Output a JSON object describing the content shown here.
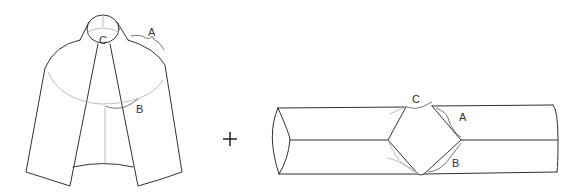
{
  "figure": {
    "left_item": {
      "name": "cape",
      "labels": {
        "a": "A",
        "b": "B",
        "c": "C"
      }
    },
    "operator": "+",
    "right_item": {
      "name": "cylinder-with-diamond-cutout",
      "labels": {
        "a": "A",
        "b": "B",
        "c": "C"
      }
    }
  },
  "colors": {
    "line": "#333333",
    "light_line": "#aaaaaa",
    "background": "#ffffff"
  }
}
